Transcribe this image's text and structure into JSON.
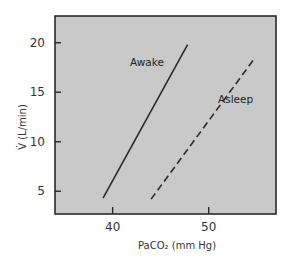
{
  "chart_data": {
    "type": "line",
    "title": "",
    "xlabel": "PaCO₂ (mm Hg)",
    "ylabel": "V̇ (L/min)",
    "xlim": [
      34,
      57
    ],
    "ylim": [
      2.7,
      22.7
    ],
    "xticks": [
      40,
      50
    ],
    "yticks": [
      5,
      10,
      15,
      20
    ],
    "grid": false,
    "legend": "none (inline labels)",
    "series": [
      {
        "name": "Awake",
        "style": "solid",
        "x": [
          39.0,
          47.8
        ],
        "y": [
          4.3,
          19.8
        ]
      },
      {
        "name": "Asleep",
        "style": "dashed",
        "x": [
          44.0,
          54.6
        ],
        "y": [
          4.2,
          18.2
        ]
      }
    ],
    "annotations": [
      {
        "text": "Awake",
        "x": 43.0,
        "y": 18.0
      },
      {
        "text": "Asleep",
        "x": 46.5,
        "y": 14.3
      }
    ]
  },
  "colors": {
    "plot_background": "#c9c9c9",
    "page_background": "#ffffff",
    "line": "#2a2a2a",
    "frame": "#2a2a2a"
  },
  "labels": {
    "x_axis": "PaCO₂ (mm Hg)",
    "y_axis": "V̇ (L/min)",
    "awake": "Awake",
    "asleep": "Asleep"
  }
}
